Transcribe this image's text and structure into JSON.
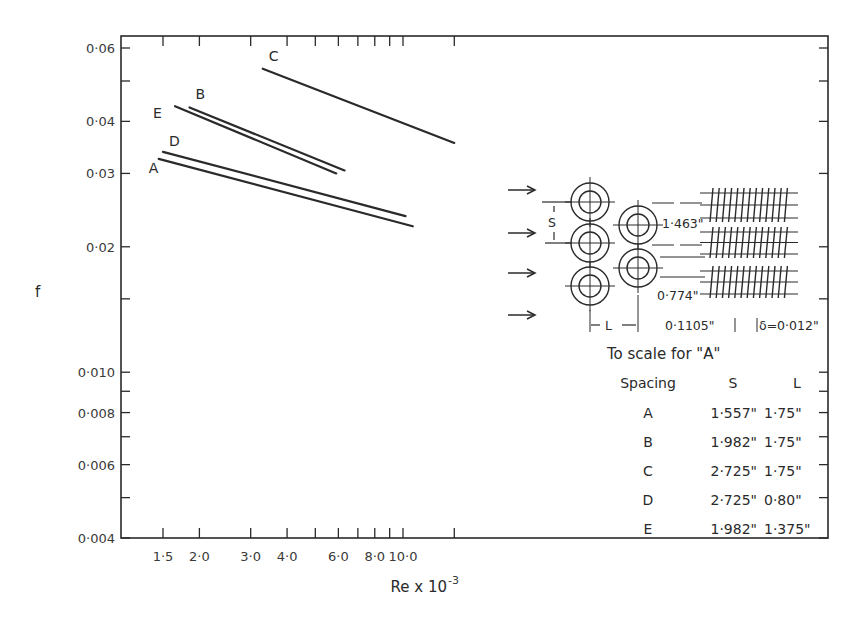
{
  "chart_data": {
    "type": "line",
    "title": "",
    "xlabel": "Re x 10^-3",
    "xlabel_main": "Re x 10",
    "xlabel_exp": "-3",
    "ylabel": "f",
    "xscale": "log",
    "yscale": "log",
    "xlim": [
      1.08,
      28
    ],
    "ylim": [
      0.004,
      0.062
    ],
    "grid": false,
    "x_ticks": [
      {
        "value": 1.5,
        "label": "1·5"
      },
      {
        "value": 2.0,
        "label": "2·0"
      },
      {
        "value": 3.0,
        "label": "3·0"
      },
      {
        "value": 4.0,
        "label": "4·0"
      },
      {
        "value": 5.0,
        "label": ""
      },
      {
        "value": 6.0,
        "label": "6·0"
      },
      {
        "value": 7.0,
        "label": ""
      },
      {
        "value": 8.0,
        "label": "8·0"
      },
      {
        "value": 9.0,
        "label": ""
      },
      {
        "value": 10.0,
        "label": "10·0"
      },
      {
        "value": 15.0,
        "label": ""
      }
    ],
    "y_ticks": [
      {
        "value": 0.06,
        "label": "0·06"
      },
      {
        "value": 0.05,
        "label": ""
      },
      {
        "value": 0.04,
        "label": "0·04"
      },
      {
        "value": 0.03,
        "label": "0·03"
      },
      {
        "value": 0.02,
        "label": "0·02"
      },
      {
        "value": 0.015,
        "label": ""
      },
      {
        "value": 0.01,
        "label": "0·010"
      },
      {
        "value": 0.009,
        "label": ""
      },
      {
        "value": 0.008,
        "label": "0·008"
      },
      {
        "value": 0.007,
        "label": ""
      },
      {
        "value": 0.006,
        "label": "0·006"
      },
      {
        "value": 0.005,
        "label": ""
      },
      {
        "value": 0.004,
        "label": "0·004"
      }
    ],
    "series": [
      {
        "name": "A",
        "x": [
          1.45,
          10.8
        ],
        "y": [
          0.0325,
          0.0224
        ]
      },
      {
        "name": "D",
        "x": [
          1.5,
          10.2
        ],
        "y": [
          0.0338,
          0.0237
        ]
      },
      {
        "name": "E",
        "x": [
          1.65,
          5.9
        ],
        "y": [
          0.0435,
          0.03
        ]
      },
      {
        "name": "B",
        "x": [
          1.85,
          6.3
        ],
        "y": [
          0.0432,
          0.0305
        ]
      },
      {
        "name": "C",
        "x": [
          3.3,
          15.0
        ],
        "y": [
          0.0535,
          0.0355
        ]
      }
    ]
  },
  "inset": {
    "caption": "To scale for \"A\"",
    "dimensions": {
      "s_label": "S",
      "l_label": "L",
      "fin_pitch_vertical": "1·463\"",
      "fin_height": "0·774\"",
      "fin_spacing": "0·1105\"",
      "fin_thickness": "δ=0·012\""
    }
  },
  "legend_table": {
    "headers": [
      "Spacing",
      "S",
      "L"
    ],
    "rows": [
      {
        "spacing": "A",
        "s": "1·557\"",
        "l": "1·75\""
      },
      {
        "spacing": "B",
        "s": "1·982\"",
        "l": "1·75\""
      },
      {
        "spacing": "C",
        "s": "2·725\"",
        "l": "1·75\""
      },
      {
        "spacing": "D",
        "s": "2·725\"",
        "l": "0·80\""
      },
      {
        "spacing": "E",
        "s": "1·982\"",
        "l": "1·375\""
      }
    ]
  },
  "colors": {
    "ink": "#2a2a2a",
    "background": "#ffffff"
  }
}
